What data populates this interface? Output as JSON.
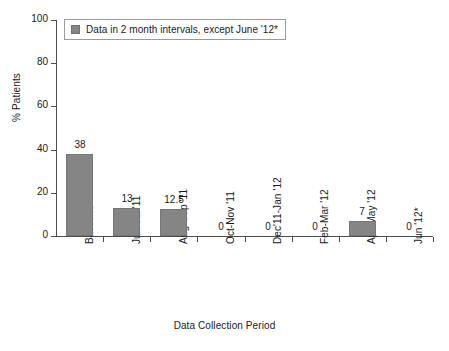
{
  "chart_data": {
    "type": "bar",
    "title": "",
    "xlabel": "Data Collection Period",
    "ylabel": "% Patients",
    "categories": [
      "Baseline",
      "Jun-Jul '11",
      "Aug-Sep '11",
      "Oct-Nov '11",
      "Dec'11-Jan '12",
      "Feb-Mar '12",
      "Apr-May '12",
      "Jun '12*"
    ],
    "values": [
      38,
      13,
      12.5,
      0,
      0,
      0,
      7,
      0
    ],
    "value_labels": [
      "38",
      "13",
      "12.5",
      "0",
      "0",
      "0",
      "7",
      "0"
    ],
    "ylim": [
      0,
      100
    ],
    "ytick_labels": [
      "100",
      "80",
      "60",
      "40",
      "20",
      "0"
    ],
    "ytick_values": [
      100,
      80,
      60,
      40,
      20,
      0
    ],
    "grid": false,
    "legend_position": "top-left",
    "legend": [
      {
        "label": "Data in 2 month intervals, except June '12*",
        "color": "#858585"
      }
    ],
    "bar_color": "#858585",
    "axis_color": "#4d4d4d",
    "background_color": "#ffffff"
  }
}
